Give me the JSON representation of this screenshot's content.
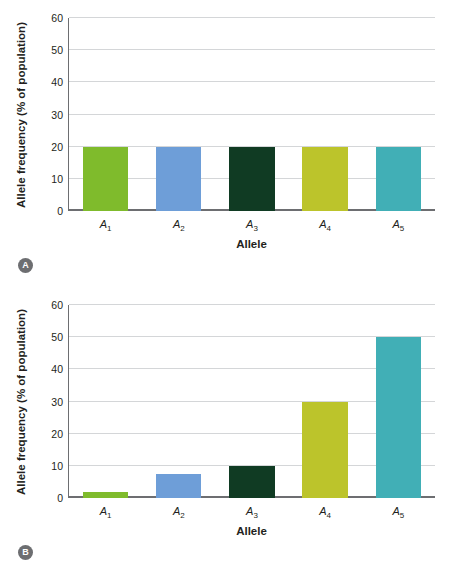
{
  "figure": {
    "panels": [
      {
        "badge": "A",
        "chart_data": {
          "type": "bar",
          "title": "",
          "xlabel": "Allele",
          "ylabel": "Allele frequency (% of population)",
          "categories": [
            "A1",
            "A2",
            "A3",
            "A4",
            "A5"
          ],
          "category_labels": [
            "A",
            "A",
            "A",
            "A",
            "A"
          ],
          "category_subscripts": [
            "1",
            "2",
            "3",
            "4",
            "5"
          ],
          "values": [
            20,
            20,
            20,
            20,
            20
          ],
          "ylim": [
            0,
            60
          ],
          "yticks": [
            0,
            10,
            20,
            30,
            40,
            50,
            60
          ],
          "grid": true,
          "legend": "none",
          "colors": [
            "#7FBB2C",
            "#6E9ED8",
            "#103B23",
            "#BCC42B",
            "#41AFB6"
          ]
        }
      },
      {
        "badge": "B",
        "chart_data": {
          "type": "bar",
          "title": "",
          "xlabel": "Allele",
          "ylabel": "Allele frequency (% of population)",
          "categories": [
            "A1",
            "A2",
            "A3",
            "A4",
            "A5"
          ],
          "category_labels": [
            "A",
            "A",
            "A",
            "A",
            "A"
          ],
          "category_subscripts": [
            "1",
            "2",
            "3",
            "4",
            "5"
          ],
          "values": [
            2,
            7.5,
            10,
            30,
            50
          ],
          "ylim": [
            0,
            60
          ],
          "yticks": [
            0,
            10,
            20,
            30,
            40,
            50,
            60
          ],
          "grid": true,
          "legend": "none",
          "colors": [
            "#7FBB2C",
            "#6E9ED8",
            "#103B23",
            "#BCC42B",
            "#41AFB6"
          ]
        }
      }
    ]
  }
}
